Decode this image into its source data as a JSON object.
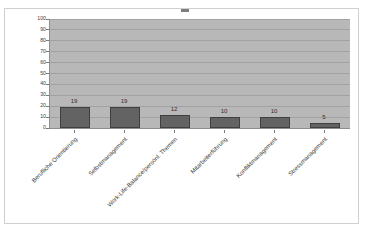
{
  "chart_data": {
    "type": "bar",
    "title": "",
    "xlabel": "",
    "ylabel": "",
    "ylim": [
      0,
      100
    ],
    "grid": true,
    "legend": "none",
    "categories": [
      "Berufliche Orientierung",
      "Selbstmanagement",
      "Work-Life-Balance/persönl. Themen",
      "Mitarbeiterführung",
      "Konfliktmanagement",
      "Stressmanagement"
    ],
    "values": [
      19,
      19,
      12,
      10,
      10,
      5
    ],
    "data_labels": [
      "19",
      "19",
      "12",
      "10",
      "10",
      "5"
    ],
    "y_ticks": [
      "100",
      "90",
      "80",
      "70",
      "60",
      "50",
      "40",
      "30",
      "20",
      "10",
      "0"
    ],
    "y_tick_values": [
      100,
      90,
      80,
      70,
      60,
      50,
      40,
      30,
      20,
      10,
      0
    ],
    "colors": {
      "bar_fill": "#636363",
      "bar_border": "#3f3f3f",
      "plot_background": "#b8b8b8",
      "gridline": "#a2a2a2",
      "axis": "#8e8e8e",
      "frame_border": "#cfcfcf",
      "text": "#3d3d3d",
      "page_background": "#ffffff"
    }
  }
}
